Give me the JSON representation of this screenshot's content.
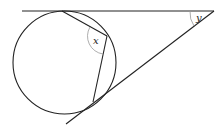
{
  "diagram": {
    "type": "geometry",
    "labels": {
      "angle_x": "x",
      "angle_y": "y"
    },
    "colors": {
      "stroke": "#222222",
      "arc": "#999999",
      "background": "#ffffff"
    }
  }
}
